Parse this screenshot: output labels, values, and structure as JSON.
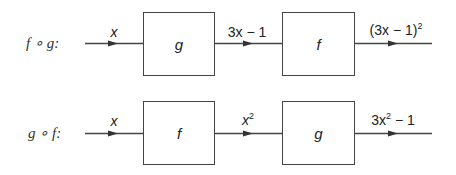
{
  "diagram": {
    "type": "function-composition-block-diagram",
    "rows": [
      {
        "label": "f ∘ g:",
        "input": "x",
        "first_box": "g",
        "intermediate": {
          "base": "3x − 1"
        },
        "second_box": "f",
        "output": {
          "text": "(3x − 1)",
          "sup": "2"
        }
      },
      {
        "label": "g ∘ f:",
        "input": "x",
        "first_box": "f",
        "intermediate": {
          "base": "x",
          "sup": "2"
        },
        "second_box": "g",
        "output": {
          "text": "3x",
          "sup": "2",
          "tail": " − 1"
        }
      }
    ]
  },
  "colors": {
    "line": "#444444",
    "text": "#222222",
    "background": "#ffffff"
  }
}
